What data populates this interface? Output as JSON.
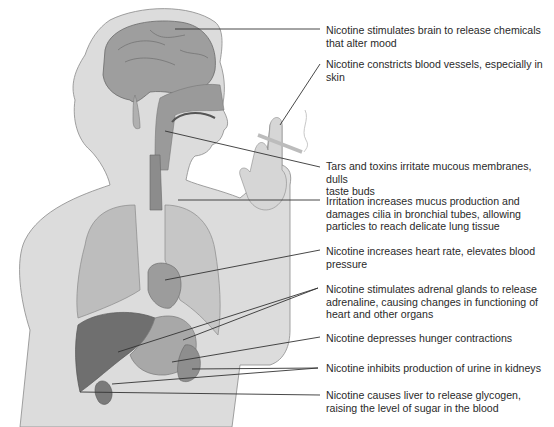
{
  "diagram": {
    "style": "grayscale anatomical illustration",
    "colors": {
      "background": "#ffffff",
      "body_silhouette": "#dcdcdc",
      "outline": "#8a8a8a",
      "organ_dark": "#7a7a7a",
      "organ_mid": "#a6a6a6",
      "organ_light": "#c4c4c4",
      "leader_line": "#333333",
      "text": "#2a2a2a"
    },
    "labels": [
      {
        "id": "brain",
        "text": "Nicotine stimulates brain to release chemicals that alter mood",
        "line1": "Nicotine stimulates brain to release chemicals",
        "line2": "that alter mood"
      },
      {
        "id": "blood-vessels",
        "text": "Nicotine constricts blood vessels, especially in skin",
        "line1": "Nicotine constricts blood vessels, especially in",
        "line2": "skin"
      },
      {
        "id": "mucous-membranes",
        "text": "Tars and toxins irritate mucous membranes, dulls taste buds",
        "line1": "Tars and toxins irritate mucous membranes, dulls",
        "line2": "taste buds"
      },
      {
        "id": "bronchial-tubes",
        "text": "Irritation increases mucus production and damages cilia in bronchial tubes, allowing particles to reach delicate lung tissue",
        "line1": "Irritation increases mucus production and",
        "line2": "damages cilia in bronchial tubes, allowing",
        "line3": "particles to reach delicate lung tissue"
      },
      {
        "id": "heart",
        "text": "Nicotine increases heart rate, elevates blood pressure",
        "line1": "Nicotine increases heart rate, elevates blood",
        "line2": "pressure"
      },
      {
        "id": "adrenal-glands",
        "text": "Nicotine stimulates adrenal glands to release adrenaline, causing changes in functioning of heart and other organs",
        "line1": "Nicotine stimulates adrenal glands to release",
        "line2": "adrenaline, causing changes in functioning of",
        "line3": "heart and other organs"
      },
      {
        "id": "stomach",
        "text": "Nicotine depresses hunger contractions",
        "line1": "Nicotine depresses hunger contractions"
      },
      {
        "id": "kidneys",
        "text": "Nicotine inhibits production of urine in kidneys",
        "line1": "Nicotine inhibits production of urine in kidneys"
      },
      {
        "id": "liver",
        "text": "Nicotine causes liver to release glycogen, raising the level of sugar in the blood",
        "line1": "Nicotine causes liver to release glycogen,",
        "line2": "raising the level of sugar in the blood"
      }
    ]
  }
}
